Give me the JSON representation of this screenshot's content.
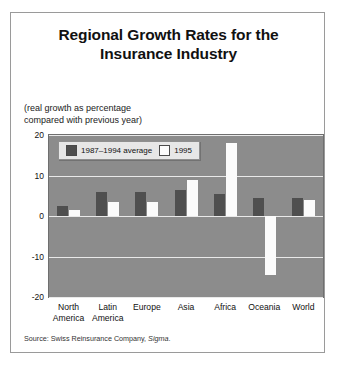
{
  "figure": {
    "title_line1": "Regional Growth Rates for the",
    "title_line2": "Insurance Industry",
    "subtitle_line1": "(real growth as percentage",
    "subtitle_line2": "compared with previous year)",
    "source_prefix": "Source: Swiss Reinsurance Company, ",
    "source_italic": "Sigma",
    "source_suffix": "."
  },
  "colors": {
    "plot_background": "#8c8c8c",
    "gridline": "#e9e9e9",
    "series_1987_1994": "#4f4f4f",
    "series_1995": "#fbfbfb",
    "page_background": "#ffffff",
    "border": "#9a9a9a"
  },
  "chart_data": {
    "type": "bar",
    "title": "Regional Growth Rates for the Insurance Industry",
    "subtitle": "(real growth as percentage compared with previous year)",
    "xlabel": "",
    "ylabel": "",
    "ylim": [
      -20,
      20
    ],
    "yticks": [
      20,
      10,
      0,
      -10,
      -20
    ],
    "ytick_labels": [
      "20",
      "10",
      "0",
      "-10",
      "-20"
    ],
    "grid": true,
    "legend_position": "top-left",
    "categories": [
      "North America",
      "Latin America",
      "Europe",
      "Asia",
      "Africa",
      "Oceania",
      "World"
    ],
    "category_lines": [
      [
        "North",
        "America"
      ],
      [
        "Latin",
        "America"
      ],
      [
        "Europe"
      ],
      [
        "Asia"
      ],
      [
        "Africa"
      ],
      [
        "Oceania"
      ],
      [
        "World"
      ]
    ],
    "series": [
      {
        "name": "1987–1994 average",
        "color": "#4f4f4f",
        "values": [
          2.5,
          6.0,
          6.0,
          6.5,
          5.5,
          4.5,
          4.5
        ]
      },
      {
        "name": "1995",
        "color": "#fbfbfb",
        "values": [
          1.5,
          3.5,
          3.5,
          9.0,
          18.0,
          -14.5,
          4.0
        ]
      }
    ]
  }
}
